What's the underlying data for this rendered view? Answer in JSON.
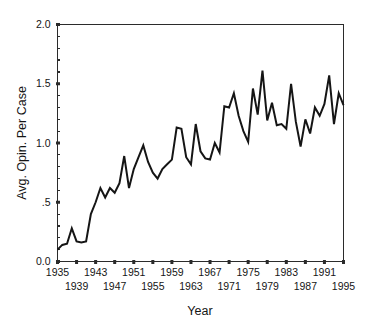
{
  "chart_data": {
    "type": "line",
    "title": "",
    "xlabel": "Year",
    "ylabel": "Avg. Opin. Per Case",
    "xlim": [
      1935,
      1995
    ],
    "ylim": [
      0.0,
      2.0
    ],
    "grid": false,
    "legend": null,
    "y_ticks": [
      {
        "value": 0.0,
        "label": "0.0"
      },
      {
        "value": 0.5,
        "label": ".5"
      },
      {
        "value": 1.0,
        "label": "1.0"
      },
      {
        "value": 1.5,
        "label": "1.5"
      },
      {
        "value": 2.0,
        "label": "2.0"
      }
    ],
    "y_minor_ticks": [
      0.1,
      0.2,
      0.3,
      0.4,
      0.6,
      0.7,
      0.8,
      0.9,
      1.1,
      1.2,
      1.3,
      1.4,
      1.6,
      1.7,
      1.8,
      1.9
    ],
    "x_ticks_upper": [
      "1935",
      "1943",
      "1951",
      "1959",
      "1967",
      "1975",
      "1983",
      "1991"
    ],
    "x_ticks_lower": [
      "1939",
      "1947",
      "1955",
      "1963",
      "1971",
      "1979",
      "1987",
      "1995"
    ],
    "x_tick_values_upper": [
      1935,
      1943,
      1951,
      1959,
      1967,
      1975,
      1983,
      1991
    ],
    "x_tick_values_lower": [
      1939,
      1947,
      1955,
      1963,
      1971,
      1979,
      1987,
      1995
    ],
    "x_tick_step": 4,
    "series": [
      {
        "name": "Avg. Opin. Per Case",
        "color": "#151515",
        "x": [
          1935,
          1936,
          1937,
          1938,
          1939,
          1940,
          1941,
          1942,
          1943,
          1944,
          1945,
          1946,
          1947,
          1948,
          1949,
          1950,
          1951,
          1952,
          1953,
          1954,
          1955,
          1956,
          1957,
          1958,
          1959,
          1960,
          1961,
          1962,
          1963,
          1964,
          1965,
          1966,
          1967,
          1968,
          1969,
          1970,
          1971,
          1972,
          1973,
          1974,
          1975,
          1976,
          1977,
          1978,
          1979,
          1980,
          1981,
          1982,
          1983,
          1984,
          1985,
          1986,
          1987,
          1988,
          1989,
          1990,
          1991,
          1992,
          1993,
          1994,
          1995
        ],
        "values": [
          0.1,
          0.14,
          0.15,
          0.28,
          0.17,
          0.16,
          0.17,
          0.4,
          0.5,
          0.62,
          0.54,
          0.62,
          0.58,
          0.66,
          0.89,
          0.62,
          0.78,
          0.88,
          0.98,
          0.84,
          0.75,
          0.7,
          0.78,
          0.82,
          0.86,
          1.13,
          1.12,
          0.88,
          0.82,
          1.16,
          0.93,
          0.87,
          0.86,
          1.0,
          0.92,
          1.31,
          1.3,
          1.42,
          1.23,
          1.1,
          1.01,
          1.46,
          1.24,
          1.61,
          1.19,
          1.34,
          1.15,
          1.16,
          1.12,
          1.5,
          1.18,
          0.97,
          1.2,
          1.08,
          1.3,
          1.23,
          1.33,
          1.57,
          1.16,
          1.42,
          1.32
        ]
      }
    ]
  },
  "axes": {
    "y_title": "Avg. Opin. Per Case",
    "x_title": "Year"
  },
  "style": {
    "line_color": "#151515",
    "axis_color": "#2b2b2b",
    "background": "#ffffff",
    "text_color": "#151515"
  }
}
